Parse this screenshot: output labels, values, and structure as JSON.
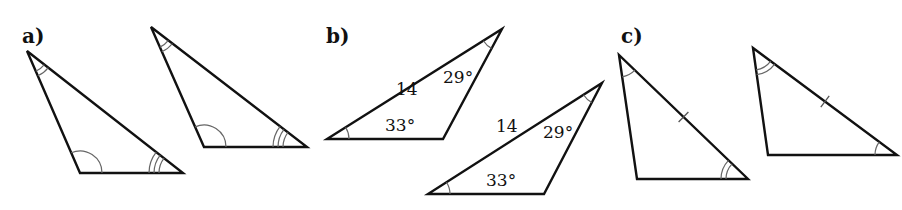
{
  "parts": [
    {
      "label": "a)",
      "label_pos": [
        22,
        43
      ],
      "triangles": [
        {
          "vertices": [
            [
              27,
              51
            ],
            [
              80,
              173
            ],
            [
              183,
              173
            ]
          ],
          "angle_marks": [
            {
              "vertex": 0,
              "arcs": 2
            },
            {
              "vertex": 1,
              "arcs": 1
            },
            {
              "vertex": 2,
              "arcs": 3
            }
          ],
          "side_ticks": [],
          "labels": []
        },
        {
          "vertices": [
            [
              151,
              27
            ],
            [
              204,
              147
            ],
            [
              307,
              147
            ]
          ],
          "angle_marks": [
            {
              "vertex": 0,
              "arcs": 2
            },
            {
              "vertex": 1,
              "arcs": 1
            },
            {
              "vertex": 2,
              "arcs": 3
            }
          ],
          "side_ticks": [],
          "labels": []
        }
      ]
    },
    {
      "label": "b)",
      "label_pos": [
        326,
        43
      ],
      "triangles": [
        {
          "vertices": [
            [
              327,
              139
            ],
            [
              443,
              139
            ],
            [
              502,
              29
            ]
          ],
          "angle_marks": [
            {
              "vertex": 0,
              "arcs": 1
            },
            {
              "vertex": 2,
              "arcs": 1
            }
          ],
          "side_ticks": [],
          "labels": [
            {
              "text": "14",
              "pos": [
                396,
                95
              ]
            },
            {
              "text": "29°",
              "pos": [
                443,
                83
              ]
            },
            {
              "text": "33°",
              "pos": [
                385,
                131
              ]
            }
          ]
        },
        {
          "vertices": [
            [
              428,
              194
            ],
            [
              544,
              194
            ],
            [
              602,
              83
            ]
          ],
          "angle_marks": [
            {
              "vertex": 0,
              "arcs": 1
            },
            {
              "vertex": 2,
              "arcs": 1
            }
          ],
          "side_ticks": [],
          "labels": [
            {
              "text": "14",
              "pos": [
                496,
                132
              ]
            },
            {
              "text": "29°",
              "pos": [
                543,
                138
              ]
            },
            {
              "text": "33°",
              "pos": [
                486,
                186
              ]
            }
          ]
        }
      ]
    },
    {
      "label": "c)",
      "label_pos": [
        621,
        43
      ],
      "triangles": [
        {
          "vertices": [
            [
              619,
              55
            ],
            [
              637,
              179
            ],
            [
              748,
              179
            ]
          ],
          "angle_marks": [
            {
              "vertex": 0,
              "arcs": 1
            },
            {
              "vertex": 2,
              "arcs": 2
            }
          ],
          "side_ticks": [
            {
              "from": 0,
              "to": 2,
              "count": 1
            }
          ],
          "labels": []
        },
        {
          "vertices": [
            [
              753,
              48
            ],
            [
              768,
              155
            ],
            [
              897,
              155
            ]
          ],
          "angle_marks": [
            {
              "vertex": 0,
              "arcs": 2
            },
            {
              "vertex": 2,
              "arcs": 1
            }
          ],
          "side_ticks": [
            {
              "from": 0,
              "to": 2,
              "count": 1
            }
          ],
          "labels": []
        }
      ]
    }
  ],
  "style": {
    "stroke_color": "#111111",
    "mark_color": "#666666",
    "background": "#ffffff"
  }
}
